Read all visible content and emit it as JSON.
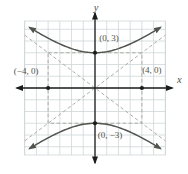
{
  "figure": {
    "background": "#ffffff",
    "colors": {
      "grid": "#ccd4d6",
      "axis": "#1c1c1c",
      "curve": "#50544d",
      "dashed": "#a8a59d",
      "label": "#514f49",
      "point": "#1c1c1c"
    },
    "axis_labels": {
      "x": "x",
      "y": "y"
    }
  },
  "chart_data": {
    "type": "line",
    "equation": "y^2/9 - x^2/16 = 1",
    "hyperbola": {
      "a": 3,
      "b": 4,
      "orientation": "vertical"
    },
    "curve_x_extent": 5.6,
    "asymptotes": [
      {
        "slope": 0.75,
        "intercept": 0
      },
      {
        "slope": -0.75,
        "intercept": 0
      }
    ],
    "central_rectangle": {
      "x_range": [
        -4,
        4
      ],
      "y_range": [
        -3,
        3
      ]
    },
    "marked_points": [
      [
        -4,
        0
      ],
      [
        4,
        0
      ],
      [
        0,
        3
      ],
      [
        0,
        -3
      ]
    ],
    "annotations": [
      {
        "text": "(0, 3)",
        "anchor": [
          0,
          3
        ],
        "offset": [
          14,
          -15
        ]
      },
      {
        "text": "(−4, 0)",
        "anchor": [
          -4,
          0
        ],
        "offset": [
          -22,
          -17
        ]
      },
      {
        "text": "(4, 0)",
        "anchor": [
          4,
          0
        ],
        "offset": [
          10,
          -18
        ]
      },
      {
        "text": "(0, −3)",
        "anchor": [
          0,
          -3
        ],
        "offset": [
          15,
          12
        ]
      }
    ],
    "axis_range": {
      "x": [
        -6,
        6
      ],
      "y": [
        -5.7,
        5.7
      ]
    },
    "grid": true,
    "legend": false
  }
}
